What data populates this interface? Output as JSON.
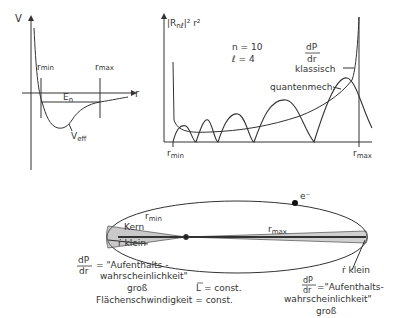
{
  "potential_diagram": {
    "y_axis_label": "V",
    "x_axis_label": "r",
    "r_min_label": "r",
    "r_min_sub": "min",
    "r_max_label": "r",
    "r_max_sub": "max",
    "energy_label": "E",
    "energy_sub": "n",
    "curve_label": "V",
    "curve_sub": "eff"
  },
  "probability_chart": {
    "y_axis_label": "|R",
    "y_axis_sub": "nℓ",
    "y_axis_tail": "|² r²",
    "n_label": "n = 10",
    "l_label": "ℓ = 4",
    "dp_num": "dP",
    "dp_den": "dr",
    "classical_label": "klassisch",
    "quantum_label": "quantenmech.",
    "r_min_label": "r",
    "r_min_sub": "min",
    "r_max_label": "r",
    "r_max_sub": "max"
  },
  "orbit_diagram": {
    "electron_label": "e⁻",
    "nucleus_label": "Kern",
    "r_min_label": "r",
    "r_min_sub": "min",
    "r_max_label": "r",
    "r_max_sub": "max",
    "left_rdot": "ṙ  klein",
    "left_dp_num": "dP",
    "left_dp_den": "dr",
    "left_line1": "= \"Aufenthalts -",
    "left_line2": "wahrscheinlichkeit\"",
    "left_line3": "groß",
    "angular_momentum": "L = const.",
    "area_velocity": "Flächenschwindigkeit = const.",
    "right_rdot": "ṙ  klein",
    "right_dp_num": "dP",
    "right_dp_den": "dr",
    "right_line1": "=\"Aufenthalts-",
    "right_line2": "wahrscheinlichkeit\"",
    "right_line3": "groß"
  }
}
